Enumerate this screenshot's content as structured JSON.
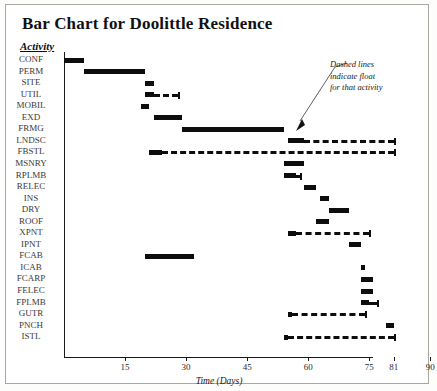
{
  "figure": {
    "title": "Bar Chart for Doolittle Residence",
    "activity_header": "Activity",
    "annotation_lines": [
      "Dashed lines",
      "indicate float",
      "for that activity"
    ]
  },
  "chart_data": {
    "type": "bar",
    "title": "Bar Chart for Doolittle Residence",
    "xlabel": "Time (Days)",
    "ylabel": "Activity",
    "xlim": [
      0,
      93
    ],
    "grid": false,
    "legend": null,
    "orientation": "horizontal",
    "note": "Gantt-style bar chart; solid bars are activity duration, dashed lines indicate float",
    "tick_values": [
      15,
      30,
      45,
      60,
      75,
      81,
      90
    ],
    "tick_labels": [
      "15",
      "30",
      "45",
      "60",
      "75",
      "81",
      "90"
    ],
    "categories": [
      "CONF",
      "PERM",
      "SITE",
      "UTIL",
      "MOBIL",
      "EXD",
      "FRMG",
      "LNDSC",
      "FBSTL",
      "MSNRY",
      "RPLMB",
      "RELEC",
      "INS",
      "DRY",
      "ROOF",
      "XPNT",
      "IPNT",
      "FCAB",
      "ICAB",
      "FCARP",
      "FELEC",
      "FPLMB",
      "GUTR",
      "PNCH",
      "ISTL"
    ],
    "bars": [
      {
        "activity": "CONF",
        "start": 0,
        "end": 5,
        "float_end": null
      },
      {
        "activity": "PERM",
        "start": 5,
        "end": 20,
        "float_end": null
      },
      {
        "activity": "SITE",
        "start": 20,
        "end": 22,
        "float_end": null
      },
      {
        "activity": "UTIL",
        "start": 20,
        "end": 22,
        "float_end": 28
      },
      {
        "activity": "MOBIL",
        "start": 19,
        "end": 21,
        "float_end": null
      },
      {
        "activity": "EXD",
        "start": 22,
        "end": 29,
        "float_end": null
      },
      {
        "activity": "FRMG",
        "start": 29,
        "end": 54,
        "float_end": null
      },
      {
        "activity": "LNDSC",
        "start": 55,
        "end": 59,
        "float_end": 81
      },
      {
        "activity": "FBSTL",
        "start": 21,
        "end": 24,
        "float_end": 81
      },
      {
        "activity": "MSNRY",
        "start": 54,
        "end": 59,
        "float_end": null
      },
      {
        "activity": "RPLMB",
        "start": 54,
        "end": 57,
        "float_end": 58
      },
      {
        "activity": "RELEC",
        "start": 59,
        "end": 62,
        "float_end": null
      },
      {
        "activity": "INS",
        "start": 63,
        "end": 65,
        "float_end": null
      },
      {
        "activity": "DRY",
        "start": 65,
        "end": 70,
        "float_end": null
      },
      {
        "activity": "ROOF",
        "start": 62,
        "end": 65,
        "float_end": null
      },
      {
        "activity": "XPNT",
        "start": 55,
        "end": 57,
        "float_end": 75
      },
      {
        "activity": "IPNT",
        "start": 70,
        "end": 73,
        "float_end": null
      },
      {
        "activity": "FCAB",
        "start": 20,
        "end": 32,
        "float_end": null
      },
      {
        "activity": "ICAB",
        "start": 73,
        "end": 74,
        "float_end": null
      },
      {
        "activity": "FCARP",
        "start": 73,
        "end": 76,
        "float_end": null
      },
      {
        "activity": "FELEC",
        "start": 73,
        "end": 76,
        "float_end": null
      },
      {
        "activity": "FPLMB",
        "start": 73,
        "end": 75,
        "float_end": 77
      },
      {
        "activity": "GUTR",
        "start": 55,
        "end": 56,
        "float_end": 74
      },
      {
        "activity": "PNCH",
        "start": 79,
        "end": 81,
        "float_end": null
      },
      {
        "activity": "ISTL",
        "start": 54,
        "end": 55,
        "float_end": 81
      }
    ]
  }
}
